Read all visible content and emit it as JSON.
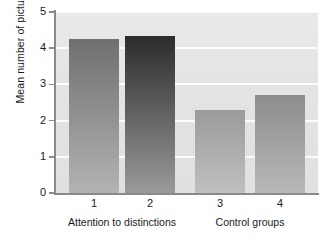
{
  "chart_data": {
    "type": "bar",
    "title": "",
    "xlabel": "",
    "ylabel": "Mean number of pictures recalled",
    "categories": [
      "1",
      "2",
      "3",
      "4"
    ],
    "values": [
      4.25,
      4.35,
      2.28,
      2.7
    ],
    "ylim": [
      0,
      5
    ],
    "yticks": [
      0,
      1,
      2,
      3,
      4,
      5
    ],
    "ytick_labels": [
      "0",
      "1",
      "2",
      "3",
      "4",
      "5"
    ],
    "grid": true,
    "grid_axis": "y",
    "legend": "none",
    "group_labels": [
      {
        "text": "Attention to distinctions",
        "categories": [
          "1",
          "2"
        ]
      },
      {
        "text": "Control groups",
        "categories": [
          "3",
          "4"
        ]
      }
    ],
    "bar_colors_top": [
      "#6f6f6f",
      "#2b2b2b",
      "#9b9b9b",
      "#8d8d8d"
    ],
    "bar_colors_bottom": [
      "#b3b3b3",
      "#9a9a9a",
      "#c0c0c0",
      "#b8b8b8"
    ],
    "plot_background": "#e5e5e5",
    "gridline_color": "#fdfdfd",
    "axis_color": "#8a8a8a",
    "text_color": "#1a1a1a"
  }
}
